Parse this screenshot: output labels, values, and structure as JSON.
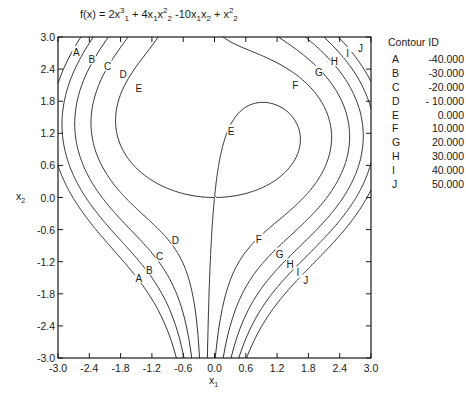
{
  "chart_data": {
    "type": "contour",
    "function": {
      "c_x1_cubed": 2,
      "c_x1_x2sq": 4,
      "c_x1_x2": -10,
      "c_x2_sq": 1
    },
    "xlabel": "x1",
    "ylabel": "x2",
    "xlim": [
      -3.0,
      3.0
    ],
    "ylim": [
      -3.0,
      3.0
    ],
    "xticks": [
      "-3.0",
      "-2.4",
      "-1.8",
      "-1.2",
      "-0.6",
      "0.0",
      "0.6",
      "1.2",
      "1.8",
      "2.4",
      "3.0"
    ],
    "yticks": [
      "3.0",
      "2.4",
      "1.8",
      "1.2",
      "0.6",
      "0.0",
      "-0.6",
      "-1.2",
      "-1.8",
      "-2.4",
      "-3.0"
    ],
    "grid": false,
    "legend_position": "right",
    "legend_title": "Contour ID",
    "contours": [
      {
        "id": "A",
        "value": -40,
        "label": "-40.000"
      },
      {
        "id": "B",
        "value": -30,
        "label": "-30.000"
      },
      {
        "id": "C",
        "value": -20,
        "label": "-20.000"
      },
      {
        "id": "D",
        "value": -10,
        "label": "- 10.000"
      },
      {
        "id": "E",
        "value": 0,
        "label": "0.000"
      },
      {
        "id": "F",
        "value": 10,
        "label": "10.000"
      },
      {
        "id": "G",
        "value": 20,
        "label": "20.000"
      },
      {
        "id": "H",
        "value": 30,
        "label": "30.000"
      },
      {
        "id": "I",
        "value": 40,
        "label": "40.000"
      },
      {
        "id": "J",
        "value": 50,
        "label": "50.000"
      }
    ],
    "label_positions": [
      {
        "id": "A",
        "x": -2.65,
        "y": 2.72
      },
      {
        "id": "B",
        "x": -2.35,
        "y": 2.58
      },
      {
        "id": "C",
        "x": -2.05,
        "y": 2.46
      },
      {
        "id": "D",
        "x": -1.75,
        "y": 2.3
      },
      {
        "id": "E",
        "x": -1.45,
        "y": 2.05
      },
      {
        "id": "E",
        "x": 0.32,
        "y": 1.25
      },
      {
        "id": "F",
        "x": 1.55,
        "y": 2.1
      },
      {
        "id": "G",
        "x": 2.0,
        "y": 2.35
      },
      {
        "id": "H",
        "x": 2.3,
        "y": 2.55
      },
      {
        "id": "I",
        "x": 2.55,
        "y": 2.7
      },
      {
        "id": "J",
        "x": 2.8,
        "y": 2.8
      },
      {
        "id": "A",
        "x": -1.45,
        "y": -1.5
      },
      {
        "id": "B",
        "x": -1.25,
        "y": -1.35
      },
      {
        "id": "C",
        "x": -1.05,
        "y": -1.1
      },
      {
        "id": "D",
        "x": -0.75,
        "y": -0.8
      },
      {
        "id": "F",
        "x": 0.85,
        "y": -0.78
      },
      {
        "id": "G",
        "x": 1.25,
        "y": -1.05
      },
      {
        "id": "H",
        "x": 1.45,
        "y": -1.25
      },
      {
        "id": "I",
        "x": 1.6,
        "y": -1.4
      },
      {
        "id": "J",
        "x": 1.75,
        "y": -1.55
      }
    ]
  },
  "title_parts": {
    "lhs": "f(x) = 2x",
    "t2": "+ 4x",
    "t3": "x",
    "t4": "-10x",
    "t5": "x",
    "t6": "+ x"
  },
  "axes": {
    "xlabel": "x",
    "xlabel_sub": "1",
    "ylabel": "x",
    "ylabel_sub": "2"
  }
}
